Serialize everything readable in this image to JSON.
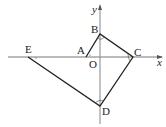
{
  "diagram": {
    "axes": {
      "x_label": "x",
      "y_label": "y",
      "origin_label": "O"
    },
    "points": [
      {
        "name": "A",
        "label": "A"
      },
      {
        "name": "B",
        "label": "B"
      },
      {
        "name": "C",
        "label": "C"
      },
      {
        "name": "D",
        "label": "D"
      },
      {
        "name": "E",
        "label": "E"
      }
    ],
    "segments": [
      "AB",
      "BC",
      "CD",
      "DE"
    ],
    "angle_marks": [
      "angle-B-right",
      "angle-C-right",
      "angle-D-right",
      "angle-E",
      "angle-A"
    ],
    "colors": {
      "line": "#222222",
      "axis": "#888888"
    }
  }
}
